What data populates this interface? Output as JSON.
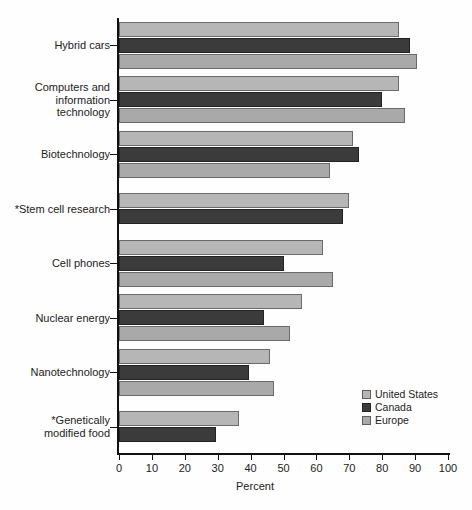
{
  "chart_data": {
    "type": "bar",
    "orientation": "horizontal",
    "title": "",
    "xlabel": "Percent",
    "ylabel": "",
    "xlim": [
      0,
      100
    ],
    "xticks": [
      0,
      10,
      20,
      30,
      40,
      50,
      60,
      70,
      80,
      90,
      100
    ],
    "xtick_labels": [
      "0",
      "10",
      "20",
      "30",
      "40",
      "50",
      "60",
      "70",
      "80",
      "90",
      "100"
    ],
    "grid": false,
    "legend_position": "bottom-right",
    "categories": [
      "Hybrid cars",
      "Computers and\ninformation\ntechnology",
      "Biotechnology",
      "*Stem cell research",
      "Cell phones",
      "Nuclear energy",
      "Nanotechnology",
      "*Genetically\nmodified food"
    ],
    "series": [
      {
        "name": "United States",
        "color": "#b6b6b6",
        "values": [
          85,
          85,
          71,
          70,
          62,
          55.5,
          46,
          36.5
        ]
      },
      {
        "name": "Canada",
        "color": "#3b3b3b",
        "values": [
          88.5,
          80,
          73,
          68,
          50,
          44,
          39.5,
          29.5
        ]
      },
      {
        "name": "Europe",
        "color": "#a9a9a9",
        "values": [
          90.5,
          87,
          64,
          null,
          65,
          52,
          47,
          null
        ]
      }
    ]
  },
  "legend": {
    "entries": [
      {
        "label": "United States",
        "swatch": "light-gray-swatch"
      },
      {
        "label": "Canada",
        "swatch": "dark-gray-swatch"
      },
      {
        "label": "Europe",
        "swatch": "medium-gray-swatch"
      }
    ]
  },
  "axis": {
    "x_title": "Percent"
  }
}
